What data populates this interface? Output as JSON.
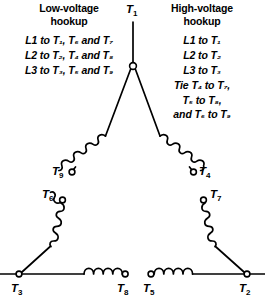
{
  "diagram": {
    "title_alt": "Three-phase delta (wye-start) motor terminal hookup diagram",
    "panels": {
      "low": {
        "title": "Low-voltage\nhookup",
        "lines": [
          "L1 to T₁, T₆ and T₇",
          "L2 to T₂, T₄ and T₈",
          "L3 to T₃, T₅ and T₉"
        ]
      },
      "high": {
        "title": "High-voltage\nhookup",
        "lines": [
          "L1 to T₁",
          "L2 to T₂",
          "L3 to T₃",
          "Tie T₄ to T₇,",
          "T₅ to T₈,",
          "and T₆ to T₉"
        ]
      }
    },
    "terminals": [
      {
        "id": "T1",
        "label": "T",
        "sub": "1"
      },
      {
        "id": "T9",
        "label": "T",
        "sub": "9"
      },
      {
        "id": "T4",
        "label": "T",
        "sub": "4"
      },
      {
        "id": "T6",
        "label": "T",
        "sub": "6"
      },
      {
        "id": "T7",
        "label": "T",
        "sub": "7"
      },
      {
        "id": "T3",
        "label": "T",
        "sub": "3"
      },
      {
        "id": "T8",
        "label": "T",
        "sub": "8"
      },
      {
        "id": "T5",
        "label": "T",
        "sub": "5"
      },
      {
        "id": "T2",
        "label": "T",
        "sub": "2"
      }
    ],
    "colors": {
      "ink": "#000000",
      "background": "#ffffff"
    }
  }
}
